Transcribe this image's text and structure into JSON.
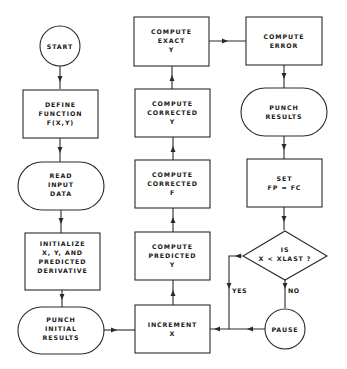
{
  "flowchart": {
    "nodes": {
      "start": {
        "shape": "circle",
        "lines": [
          "START"
        ]
      },
      "define_function": {
        "shape": "rect",
        "lines": [
          "DEFINE",
          "FUNCTION",
          "F(X,Y)"
        ]
      },
      "read_input": {
        "shape": "pill",
        "lines": [
          "READ",
          "INPUT",
          "DATA"
        ]
      },
      "initialize": {
        "shape": "rect",
        "lines": [
          "INITIALIZE",
          "X, Y, AND",
          "PREDICTED",
          "DERIVATIVE"
        ]
      },
      "punch_initial": {
        "shape": "pill",
        "lines": [
          "PUNCH",
          "INITIAL",
          "RESULTS"
        ]
      },
      "increment_x": {
        "shape": "rect",
        "lines": [
          "INCREMENT",
          "X"
        ]
      },
      "compute_predicted_y": {
        "shape": "rect",
        "lines": [
          "COMPUTE",
          "PREDICTED",
          "Y"
        ]
      },
      "compute_corrected_f": {
        "shape": "rect",
        "lines": [
          "COMPUTE",
          "CORRECTED",
          "F"
        ]
      },
      "compute_corrected_y": {
        "shape": "rect",
        "lines": [
          "COMPUTE",
          "CORRECTED",
          "Y"
        ]
      },
      "compute_exact_y": {
        "shape": "rect",
        "lines": [
          "COMPUTE",
          "EXACT",
          "Y"
        ]
      },
      "compute_error": {
        "shape": "rect",
        "lines": [
          "COMPUTE",
          "ERROR"
        ]
      },
      "punch_results": {
        "shape": "pill",
        "lines": [
          "PUNCH",
          "RESULTS"
        ]
      },
      "set_fp": {
        "shape": "rect",
        "lines": [
          "SET",
          "FP = FC"
        ]
      },
      "decision": {
        "shape": "diamond",
        "lines": [
          "IS",
          "X < XLAST ?"
        ]
      },
      "pause": {
        "shape": "circle",
        "lines": [
          "PAUSE"
        ]
      }
    },
    "edge_labels": {
      "yes": "YES",
      "no": "NO"
    },
    "edges": [
      {
        "from": "start",
        "to": "define_function"
      },
      {
        "from": "define_function",
        "to": "read_input"
      },
      {
        "from": "read_input",
        "to": "initialize"
      },
      {
        "from": "initialize",
        "to": "punch_initial"
      },
      {
        "from": "punch_initial",
        "to": "increment_x"
      },
      {
        "from": "increment_x",
        "to": "compute_predicted_y"
      },
      {
        "from": "compute_predicted_y",
        "to": "compute_corrected_f"
      },
      {
        "from": "compute_corrected_f",
        "to": "compute_corrected_y"
      },
      {
        "from": "compute_corrected_y",
        "to": "compute_exact_y"
      },
      {
        "from": "compute_exact_y",
        "to": "compute_error"
      },
      {
        "from": "compute_error",
        "to": "punch_results"
      },
      {
        "from": "punch_results",
        "to": "set_fp"
      },
      {
        "from": "set_fp",
        "to": "decision"
      },
      {
        "from": "decision",
        "to": "increment_x",
        "label": "YES"
      },
      {
        "from": "decision",
        "to": "pause",
        "label": "NO"
      },
      {
        "from": "pause",
        "to": "increment_x"
      }
    ]
  }
}
